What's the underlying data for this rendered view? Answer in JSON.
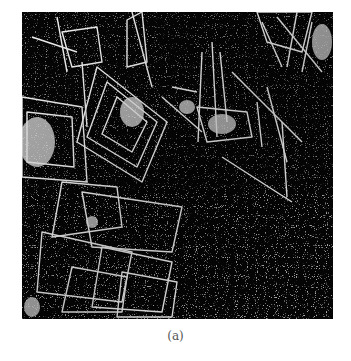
{
  "figure": {
    "colors": {
      "background": "#050505",
      "foreground": "#f0f0f0",
      "page": "#ffffff"
    }
  },
  "caption": {
    "label": "(a)"
  }
}
